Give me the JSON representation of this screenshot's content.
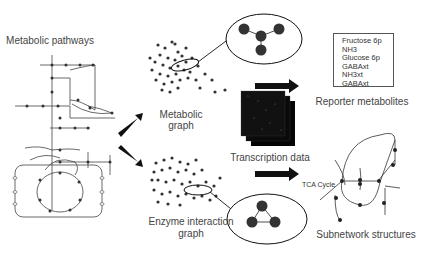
{
  "labels": {
    "metabolic_pathways": "Metabolic pathways",
    "metabolic_graph_1": "Metabolic",
    "metabolic_graph_2": "graph",
    "transcription_data": "Transcription data",
    "reporter_metabolites": "Reporter metabolites",
    "enzyme_graph_1": "Enzyme interaction",
    "enzyme_graph_2": "graph",
    "subnetwork_structures": "Subnetwork structures",
    "tca_cycle": "TCA Cycle"
  },
  "reporter_metabolites_list": [
    "Fructose 6p",
    "NH3",
    "Glucose 6p",
    "GABAxt",
    "NH3xt",
    "GABAxt"
  ],
  "metabolic_graph_inset_nodes": [
    "PGI",
    "PGP",
    "PFK",
    "FBP"
  ],
  "enzyme_graph_inset_nodes": [
    "PGI",
    "FBP",
    "PFK"
  ],
  "colors": {
    "node": "#333333",
    "line": "#444444",
    "background": "#ffffff"
  }
}
